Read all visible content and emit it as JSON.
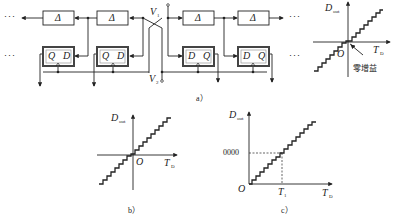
{
  "figure": {
    "panel_a": {
      "caption": "a）",
      "delay_chain": {
        "left_delays": [
          {
            "label": "Δ"
          },
          {
            "label": "Δ"
          }
        ],
        "right_delays": [
          {
            "label": "Δ"
          },
          {
            "label": "Δ"
          }
        ],
        "left_flipflops": [
          {
            "q": "Q",
            "d": "D"
          },
          {
            "q": "Q",
            "d": "D"
          }
        ],
        "right_flipflops": [
          {
            "d": "D",
            "q": "Q"
          },
          {
            "d": "D",
            "q": "Q"
          }
        ],
        "ellipsis": "···",
        "inputs": {
          "v1": "V",
          "v1_sub": "1",
          "v2": "V",
          "v2_sub": "2"
        }
      },
      "transfer_plot": {
        "y_label": "D",
        "y_sub": "out",
        "x_label": "T",
        "x_sub": "D",
        "origin": "O",
        "annotation": "零增益"
      }
    },
    "panel_b": {
      "caption": "b）",
      "y_label": "D",
      "y_sub": "out",
      "x_label": "T",
      "x_sub": "D",
      "origin": "O"
    },
    "panel_c": {
      "caption": "c）",
      "y_label": "D",
      "y_sub": "out",
      "x_label": "T",
      "x_sub": "D",
      "origin": "O",
      "y_marker": "0000",
      "x_marker": "T",
      "x_marker_sub": "1"
    }
  }
}
